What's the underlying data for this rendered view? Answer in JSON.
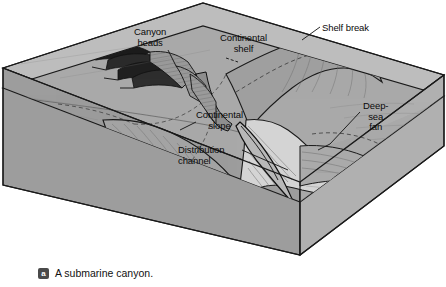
{
  "figure": {
    "type": "block-diagram",
    "subject": "A submarine canyon",
    "caption": {
      "badge": "a",
      "text": "A submarine canyon."
    },
    "colors": {
      "ocean_water_face": "#b9b9b9",
      "seafloor_top": "#a8a8a8",
      "block_side_face": "#9e9e9e",
      "block_front_face": "#a3a3a3",
      "fan_highlight": "#d8d8d8",
      "outline": "#1a1a1a",
      "label_text": "#0a0a0a",
      "page_background": "#ffffff",
      "badge_background": "#4a4a4a"
    },
    "labels": [
      {
        "id": "canyon-heads",
        "text": "Canyon\nheads",
        "x": 134,
        "y": 27
      },
      {
        "id": "continental-shelf",
        "text": "Continental\nshelf",
        "x": 220,
        "y": 33
      },
      {
        "id": "shelf-break",
        "text": "Shelf break",
        "x": 322,
        "y": 23
      },
      {
        "id": "continental-slope",
        "text": "Continental\nslope",
        "x": 196,
        "y": 110
      },
      {
        "id": "distribution-channel",
        "text": "Distribution\nchannel",
        "x": 178,
        "y": 145
      },
      {
        "id": "deep-sea-fan",
        "text": "Deep-\nsea\nfan",
        "x": 363,
        "y": 101
      }
    ],
    "features": [
      "Continental shelf",
      "Shelf break",
      "Canyon heads",
      "Continental slope",
      "Submarine canyon",
      "Distribution channel",
      "Deep-sea fan",
      "Abyssal plain"
    ]
  }
}
